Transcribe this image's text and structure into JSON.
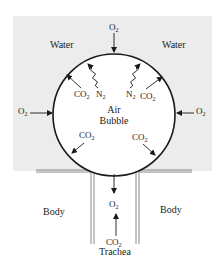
{
  "diagram": {
    "title": "",
    "colors": {
      "water": "#ececec",
      "bubble": "#ffffff",
      "ink": "#1a1a1a",
      "wall": "#888888"
    },
    "labels": {
      "water_left": "Water",
      "water_right": "Water",
      "air": "Air",
      "bubble": "Bubble",
      "body_left": "Body",
      "body_right": "Body",
      "trachea": "Trachea"
    },
    "gases": {
      "top_o2": {
        "base": "O",
        "sub": "2"
      },
      "left_o2": {
        "base": "O",
        "sub": "2"
      },
      "right_o2": {
        "base": "O",
        "sub": "2"
      },
      "upper_left_co2": {
        "base": "CO",
        "sub": "2"
      },
      "upper_left_n2": {
        "base": "N",
        "sub": "2"
      },
      "upper_right_n2": {
        "base": "N",
        "sub": "2"
      },
      "upper_right_co2": {
        "base": "CO",
        "sub": "2"
      },
      "lower_left_co2": {
        "base": "CO",
        "sub": "2"
      },
      "lower_right_co2": {
        "base": "CO",
        "sub": "2"
      },
      "trachea_o2": {
        "base": "O",
        "sub": "2"
      },
      "trachea_co2": {
        "base": "CO",
        "sub": "2"
      }
    }
  }
}
